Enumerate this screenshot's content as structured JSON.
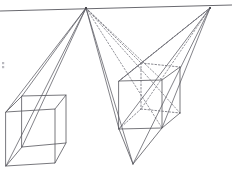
{
  "figure": {
    "type": "line-drawing",
    "width": 232,
    "height": 170,
    "background_color": "#ffffff",
    "line_color": "#55555c",
    "hidden_line_color": "#73737b",
    "horizon_color": "#6a6a70"
  },
  "horizon": {
    "label": "horizon-line",
    "x1": 0,
    "y1": 11,
    "x2": 232,
    "y2": 5
  },
  "vanishing_points": [
    {
      "name": "left-vanishing-point",
      "label": "VP1",
      "x": 86,
      "y": 8
    },
    {
      "name": "right-vanishing-point",
      "label": "VP2",
      "x": 210,
      "y": 8
    }
  ],
  "left_cube": {
    "name": "left-cube",
    "description": "Cube drawn below the horizon, seen from above, all edges solid",
    "front_face": {
      "top_left": [
        6,
        112
      ],
      "top_right": [
        55,
        109
      ],
      "bottom_right": [
        55,
        163
      ],
      "bottom_left": [
        6,
        166
      ]
    },
    "back_face": {
      "top_left": [
        22,
        96
      ],
      "top_right": [
        66,
        95
      ],
      "bottom_right": [
        66,
        143
      ],
      "bottom_left": [
        22,
        147
      ]
    }
  },
  "right_cube": {
    "name": "right-cube",
    "description": "Cube drawn below the horizon with dotted hidden edges on the far top/back",
    "front_face": {
      "top_left": [
        119,
        81
      ],
      "top_right": [
        162,
        80
      ],
      "bottom_right": [
        162,
        128
      ],
      "bottom_left": [
        119,
        129
      ]
    },
    "back_face": {
      "top_left": [
        141,
        63
      ],
      "top_right": [
        180,
        67
      ],
      "bottom_right": [
        180,
        113
      ],
      "bottom_left": [
        141,
        109
      ]
    },
    "lower_apex": [
      133,
      164
    ]
  },
  "construction_rays": {
    "name": "construction-rays",
    "left_vp_solid_count": 4,
    "left_vp_dotted_count": 4,
    "right_vp_solid_count": 4,
    "right_vp_dotted_count": 3,
    "note": "Solid rays mark visible edges; dotted rays mark receding hidden edges"
  },
  "stray_mark": {
    "name": "stray-mark",
    "x": 2,
    "y": 62,
    "width": 3,
    "height": 6
  }
}
